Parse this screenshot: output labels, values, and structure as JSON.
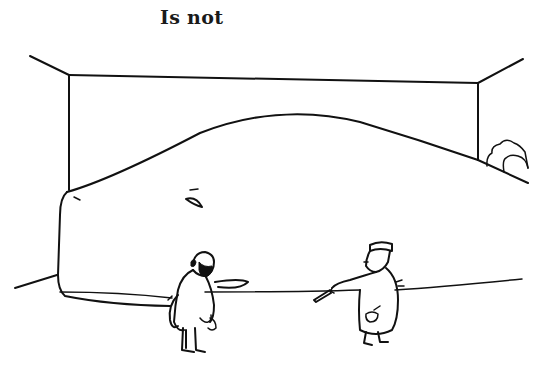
{
  "caption": {
    "text": "Is not"
  },
  "illustration": {
    "style": "black ink line drawing",
    "ink_color": "#111111",
    "background_color": "#ffffff",
    "subjects": [
      "room-walls",
      "large-mound-object",
      "man-with-beard-in-tailcoat",
      "man-in-cap-and-apron-pointing",
      "shrub-in-corner"
    ]
  }
}
